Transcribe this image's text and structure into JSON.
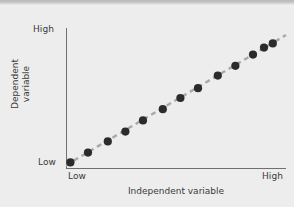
{
  "figure": {
    "background_color": "#ededec",
    "axis_color": "#6f6f6f",
    "marker_color": "#2b2b2b",
    "trendline_color": "#a9a9a9"
  },
  "chart_data": {
    "type": "scatter",
    "title": "",
    "subtitle": "",
    "xlabel": "Independent variable",
    "ylabel": "Dependent\nvariable",
    "ylabel_lines": [
      "Dependent",
      "variable"
    ],
    "xtick_labels": [
      "Low",
      "High"
    ],
    "ytick_labels": [
      "Low",
      "High"
    ],
    "xlim": [
      0,
      1
    ],
    "ylim": [
      0,
      1
    ],
    "grid": false,
    "legend": "none",
    "annotation": "Positive linear correlation between independent and dependent variable",
    "x": [
      0.02,
      0.1,
      0.19,
      0.27,
      0.35,
      0.44,
      0.52,
      0.6,
      0.69,
      0.77,
      0.85,
      0.9,
      0.94
    ],
    "y": [
      0.04,
      0.11,
      0.19,
      0.26,
      0.34,
      0.42,
      0.5,
      0.57,
      0.66,
      0.73,
      0.81,
      0.86,
      0.89
    ],
    "series": [
      {
        "name": "observations",
        "marker": "circle",
        "values": [
          0.04,
          0.11,
          0.19,
          0.26,
          0.34,
          0.42,
          0.5,
          0.57,
          0.66,
          0.73,
          0.81,
          0.86,
          0.89
        ]
      }
    ],
    "trendline": {
      "style": "dashed",
      "x_start": 0.0,
      "y_start": 0.02,
      "x_end": 1.0,
      "y_end": 0.95
    }
  }
}
